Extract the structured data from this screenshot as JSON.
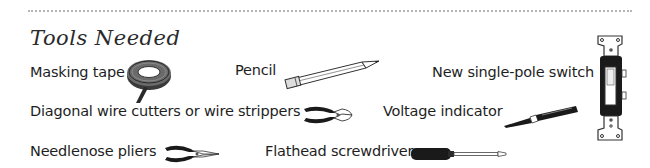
{
  "section": {
    "title": "Tools Needed",
    "divider": "dotted"
  },
  "tools": [
    {
      "label": "Masking tape",
      "icon": "masking-tape-icon"
    },
    {
      "label": "Pencil",
      "icon": "pencil-icon"
    },
    {
      "label": "New single-pole switch",
      "icon": "single-pole-switch-icon"
    },
    {
      "label": "Diagonal wire cutters or wire strippers",
      "icon": "wire-cutters-icon"
    },
    {
      "label": "Voltage indicator",
      "icon": "voltage-indicator-icon"
    },
    {
      "label": "Needlenose pliers",
      "icon": "needlenose-pliers-icon"
    },
    {
      "label": "Flathead screwdriver",
      "icon": "flathead-screwdriver-icon"
    }
  ],
  "colors": {
    "text": "#1e1e1e",
    "divider": "#b5b5b5",
    "icon_dark": "#1a1a1a",
    "background": "#ffffff"
  }
}
